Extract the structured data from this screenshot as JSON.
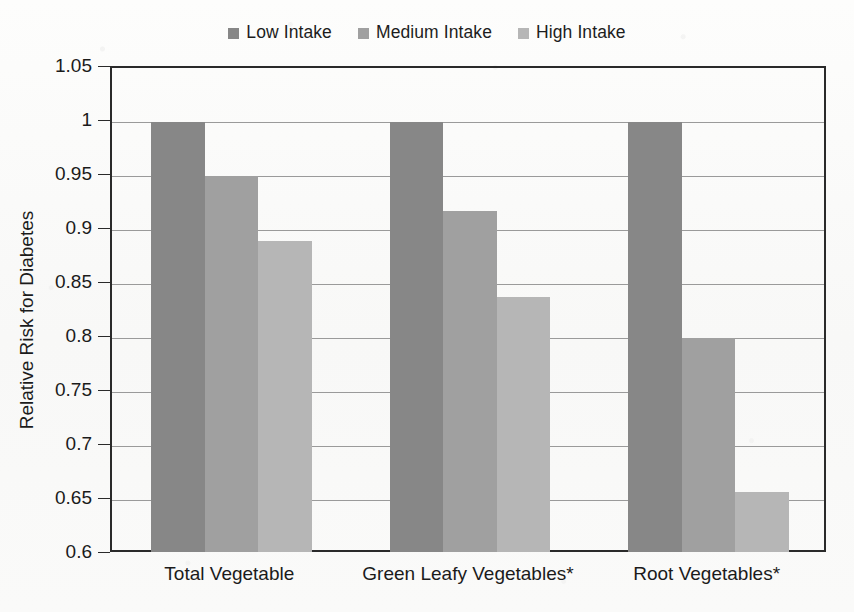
{
  "chart_data": {
    "type": "bar",
    "title": "",
    "xlabel": "",
    "ylabel": "Relative Risk for Diabetes",
    "categories": [
      "Total Vegetable",
      "Green Leafy Vegetables*",
      "Root Vegetables*"
    ],
    "series": [
      {
        "name": "Low Intake",
        "color": "#878787",
        "values": [
          1.0,
          1.0,
          1.0
        ]
      },
      {
        "name": "Medium Intake",
        "color": "#a0a0a0",
        "values": [
          0.95,
          0.918,
          0.8
        ]
      },
      {
        "name": "High Intake",
        "color": "#b6b6b6",
        "values": [
          0.89,
          0.838,
          0.657
        ]
      }
    ],
    "ylim": [
      0.6,
      1.05
    ],
    "yticks": [
      1.05,
      1,
      0.95,
      0.9,
      0.85,
      0.8,
      0.75,
      0.7,
      0.65,
      0.6
    ],
    "ytick_labels": [
      "1.05",
      "1",
      "0.95",
      "0.9",
      "0.85",
      "0.8",
      "0.75",
      "0.7",
      "0.65",
      "0.6"
    ],
    "grid": true,
    "legend_position": "top-center",
    "axis_color": "#2a2a2a",
    "grid_color": "#9a9a9a",
    "background": "#fbfbfa"
  },
  "legend": {
    "items": [
      {
        "label": "Low Intake",
        "swatch_name": "legend-swatch-low-intake"
      },
      {
        "label": "Medium Intake",
        "swatch_name": "legend-swatch-medium-intake"
      },
      {
        "label": "High Intake",
        "swatch_name": "legend-swatch-high-intake"
      }
    ]
  }
}
